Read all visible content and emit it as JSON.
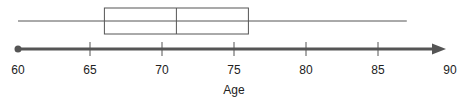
{
  "chart_data": {
    "type": "boxplot",
    "title": "",
    "xlabel": "Age",
    "ylabel": "",
    "xlim": [
      60,
      90
    ],
    "ticks": [
      60,
      65,
      70,
      75,
      80,
      85,
      90
    ],
    "tick_labels": [
      "60",
      "65",
      "70",
      "75",
      "80",
      "85",
      "90"
    ],
    "grid": false,
    "legend": null,
    "orientation": "horizontal",
    "series": [
      {
        "name": "Age",
        "min": 60,
        "q1": 66,
        "median": 71,
        "q3": 76,
        "max": 87
      }
    ],
    "axis_style": {
      "arrow_right": true,
      "dot_left": true
    }
  },
  "colors": {
    "box_stroke": "#555555",
    "axis": "#555555",
    "text": "#222222"
  }
}
